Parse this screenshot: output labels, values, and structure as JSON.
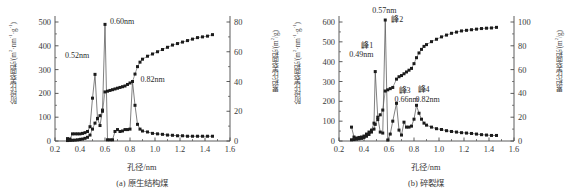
{
  "figure": {
    "panels": [
      {
        "id": "a",
        "caption": "(a) 原生结构煤",
        "xlabel": "孔径/nm",
        "ylabel_left_prefix": "阶段比表面积/(m",
        "ylabel_left_sup1": "2",
        "ylabel_left_mid": "·nm",
        "ylabel_left_sup2": "-1",
        "ylabel_left_mid2": "·g",
        "ylabel_left_sup3": "-1",
        "ylabel_left_suffix": ")",
        "ylabel_right_prefix": "累积比表面积/(m",
        "ylabel_right_sup": "2",
        "ylabel_right_suffix": "/g)",
        "annotations": [
          {
            "text": "0.52nm",
            "x": 0.52
          },
          {
            "text": "0.60nm",
            "x": 0.6
          },
          {
            "text": "0.82nm",
            "x": 0.82
          }
        ]
      },
      {
        "id": "b",
        "caption": "(b) 碎裂煤",
        "xlabel": "孔径/nm",
        "ylabel_left_prefix": "阶段比表面积/(m",
        "ylabel_left_sup1": "2",
        "ylabel_left_mid": "·nm",
        "ylabel_left_sup2": "-1",
        "ylabel_left_mid2": "·g",
        "ylabel_left_sup3": "-1",
        "ylabel_left_suffix": ")",
        "ylabel_right_prefix": "累积比表面积/(m",
        "ylabel_right_sup": "2",
        "ylabel_right_suffix": "/g)",
        "annotations": [
          {
            "text": "峰1",
            "x": 0.49
          },
          {
            "text": "0.49nm",
            "x": 0.49
          },
          {
            "text": "0.57nm",
            "x": 0.57
          },
          {
            "text": "峰2",
            "x": 0.57
          },
          {
            "text": "峰3",
            "x": 0.66
          },
          {
            "text": "0.66nm",
            "x": 0.66
          },
          {
            "text": "峰4",
            "x": 0.82
          },
          {
            "text": "0.82nm",
            "x": 0.82
          }
        ]
      }
    ]
  },
  "chart_data": [
    {
      "type": "line",
      "panel": "a",
      "title": "(a) 原生结构煤",
      "xlabel": "孔径/nm",
      "ylabel": "阶段比表面积/(m2·nm-1·g-1)",
      "y2label": "累积比表面积/(m2/g)",
      "xlim": [
        0.2,
        1.6
      ],
      "xticks": [
        0.2,
        0.4,
        0.6,
        0.8,
        1.0,
        1.2,
        1.4,
        1.6
      ],
      "xticklabels": [
        "0.2",
        "0.4",
        "0.6",
        "0.8",
        "1.0",
        "1.2",
        "1.4",
        "1.6"
      ],
      "ylim": [
        0,
        500
      ],
      "yticks": [
        0,
        100,
        200,
        300,
        400,
        500
      ],
      "yticklabels": [
        "0",
        "100",
        "200",
        "300",
        "400",
        "500"
      ],
      "y2lim": [
        0,
        80
      ],
      "y2ticks": [
        0,
        20,
        40,
        60,
        80
      ],
      "y2ticklabels": [
        "0",
        "20",
        "40",
        "60",
        "80"
      ],
      "grid": false,
      "legend": "none",
      "marker": "square",
      "series": [
        {
          "name": "阶段比表面积",
          "axis": "left",
          "x": [
            0.3,
            0.32,
            0.34,
            0.36,
            0.38,
            0.4,
            0.42,
            0.44,
            0.46,
            0.48,
            0.5,
            0.52,
            0.54,
            0.56,
            0.58,
            0.6,
            0.62,
            0.64,
            0.66,
            0.68,
            0.7,
            0.72,
            0.74,
            0.76,
            0.78,
            0.8,
            0.82,
            0.84,
            0.86,
            0.88,
            0.9,
            0.94,
            0.98,
            1.02,
            1.06,
            1.1,
            1.14,
            1.18,
            1.22,
            1.26,
            1.3,
            1.34,
            1.38,
            1.42,
            1.46
          ],
          "values": [
            10,
            8,
            30,
            30,
            30,
            30,
            32,
            35,
            40,
            60,
            180,
            280,
            95,
            65,
            130,
            490,
            5,
            5,
            5,
            40,
            48,
            40,
            42,
            48,
            48,
            50,
            250,
            150,
            70,
            50,
            42,
            38,
            32,
            30,
            28,
            25,
            24,
            22,
            22,
            20,
            20,
            20,
            20,
            20,
            20
          ]
        },
        {
          "name": "累积比表面积",
          "axis": "right",
          "x": [
            0.3,
            0.32,
            0.34,
            0.36,
            0.38,
            0.4,
            0.42,
            0.44,
            0.46,
            0.48,
            0.5,
            0.52,
            0.54,
            0.56,
            0.58,
            0.6,
            0.62,
            0.64,
            0.66,
            0.68,
            0.7,
            0.72,
            0.74,
            0.76,
            0.78,
            0.8,
            0.82,
            0.84,
            0.86,
            0.88,
            0.9,
            0.94,
            0.98,
            1.02,
            1.06,
            1.1,
            1.14,
            1.18,
            1.22,
            1.26,
            1.3,
            1.34,
            1.38,
            1.42,
            1.46
          ],
          "values": [
            0.3,
            0.4,
            0.5,
            0.6,
            0.8,
            1.0,
            1.3,
            1.8,
            2.5,
            4.0,
            8.0,
            12.0,
            15.0,
            17.0,
            20.0,
            33.0,
            33.5,
            34.0,
            34.5,
            35.0,
            35.5,
            36.0,
            36.5,
            37.0,
            38.0,
            39.0,
            40.0,
            45.0,
            50.0,
            53.0,
            55.0,
            57.0,
            58.5,
            60.0,
            61.5,
            63.0,
            64.5,
            65.5,
            66.5,
            67.5,
            68.5,
            69.5,
            70.0,
            70.5,
            71.5
          ]
        }
      ]
    },
    {
      "type": "line",
      "panel": "b",
      "title": "(b) 碎裂煤",
      "xlabel": "孔径/nm",
      "ylabel": "阶段比表面积/(m2·nm-1·g-1)",
      "y2label": "累积比表面积/(m2/g)",
      "xlim": [
        0.2,
        1.6
      ],
      "xticks": [
        0.2,
        0.4,
        0.6,
        0.8,
        1.0,
        1.2,
        1.4,
        1.6
      ],
      "xticklabels": [
        "0.2",
        "0.4",
        "0.6",
        "0.8",
        "1.0",
        "1.2",
        "1.4",
        "1.6"
      ],
      "ylim": [
        0,
        600
      ],
      "yticks": [
        0,
        100,
        200,
        300,
        400,
        500,
        600
      ],
      "yticklabels": [
        "0",
        "100",
        "200",
        "300",
        "400",
        "500",
        "600"
      ],
      "y2lim": [
        0,
        100
      ],
      "y2ticks": [
        0,
        20,
        40,
        60,
        80,
        100
      ],
      "y2ticklabels": [
        "0",
        "20",
        "40",
        "60",
        "80",
        "100"
      ],
      "grid": false,
      "legend": "none",
      "marker": "square",
      "peaks": [
        {
          "label": "峰1",
          "x": 0.49,
          "value": 350
        },
        {
          "label": "峰2",
          "x": 0.57,
          "value": 610
        },
        {
          "label": "峰3",
          "x": 0.66,
          "value": 190
        },
        {
          "label": "峰4",
          "x": 0.82,
          "value": 180
        }
      ],
      "series": [
        {
          "name": "阶段比表面积",
          "axis": "left",
          "x": [
            0.3,
            0.32,
            0.34,
            0.36,
            0.38,
            0.4,
            0.42,
            0.44,
            0.46,
            0.48,
            0.49,
            0.51,
            0.53,
            0.55,
            0.57,
            0.59,
            0.61,
            0.63,
            0.66,
            0.68,
            0.7,
            0.72,
            0.74,
            0.76,
            0.78,
            0.8,
            0.82,
            0.84,
            0.86,
            0.88,
            0.9,
            0.94,
            0.98,
            1.02,
            1.06,
            1.1,
            1.14,
            1.18,
            1.22,
            1.26,
            1.3,
            1.34,
            1.38,
            1.42,
            1.46
          ],
          "values": [
            70,
            20,
            15,
            18,
            20,
            25,
            35,
            45,
            55,
            90,
            350,
            120,
            45,
            40,
            610,
            5,
            35,
            100,
            190,
            55,
            30,
            95,
            70,
            70,
            75,
            110,
            180,
            140,
            110,
            90,
            80,
            70,
            62,
            58,
            52,
            48,
            45,
            42,
            40,
            38,
            35,
            32,
            30,
            28,
            28
          ]
        },
        {
          "name": "累积比表面积",
          "axis": "right",
          "x": [
            0.3,
            0.32,
            0.34,
            0.36,
            0.38,
            0.4,
            0.42,
            0.44,
            0.46,
            0.48,
            0.49,
            0.51,
            0.53,
            0.55,
            0.57,
            0.59,
            0.61,
            0.63,
            0.66,
            0.68,
            0.7,
            0.72,
            0.74,
            0.76,
            0.78,
            0.8,
            0.82,
            0.84,
            0.86,
            0.88,
            0.9,
            0.94,
            0.98,
            1.02,
            1.06,
            1.1,
            1.14,
            1.18,
            1.22,
            1.26,
            1.3,
            1.34,
            1.38,
            1.42,
            1.46
          ],
          "values": [
            1.0,
            1.2,
            1.5,
            1.8,
            2.2,
            3.0,
            4.0,
            5.5,
            7.5,
            10.0,
            14.0,
            18.0,
            22.0,
            26.0,
            42.0,
            43.0,
            44.0,
            45.0,
            52.0,
            54.0,
            55.0,
            56.5,
            58.0,
            59.5,
            61.0,
            65.0,
            70.0,
            74.0,
            77.0,
            79.5,
            81.0,
            83.5,
            85.5,
            87.5,
            89.0,
            90.5,
            91.5,
            92.5,
            93.0,
            93.5,
            94.0,
            94.5,
            94.8,
            95.0,
            95.5
          ]
        }
      ]
    }
  ]
}
